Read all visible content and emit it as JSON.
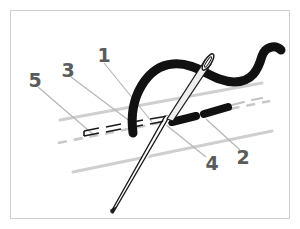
{
  "figure": {
    "background_color": "#ffffff",
    "border_color": "#d0d0d0",
    "ink_color": "#111111",
    "fabric_line_color": "#c8c8c8",
    "leader_line_color": "#b0b0b0",
    "label_color": "#5b5b5b"
  },
  "callouts": [
    {
      "id": "callout-1",
      "label": "1",
      "x": 104,
      "y": 58,
      "meaning": "thread"
    },
    {
      "id": "callout-2",
      "label": "2",
      "x": 243,
      "y": 158,
      "meaning": "completed-stitch"
    },
    {
      "id": "callout-3",
      "label": "3",
      "x": 67,
      "y": 73,
      "meaning": "stitch-line"
    },
    {
      "id": "callout-4",
      "label": "4",
      "x": 210,
      "y": 163,
      "meaning": "needle-entry-point"
    },
    {
      "id": "callout-5",
      "label": "5",
      "x": 34,
      "y": 83,
      "meaning": "fabric-guide-line"
    }
  ],
  "elements": {
    "needle": "sewing-needle",
    "needle_eye": "needle-eye",
    "thread": "thread-curve",
    "stitches": "stitch-dashes",
    "fabric_top_line": "fabric-line-upper",
    "fabric_bottom_line": "fabric-line-lower",
    "dashed_stitch_line": "dashed-stitch-line",
    "dashed_guide_line": "dashed-guide-line"
  }
}
